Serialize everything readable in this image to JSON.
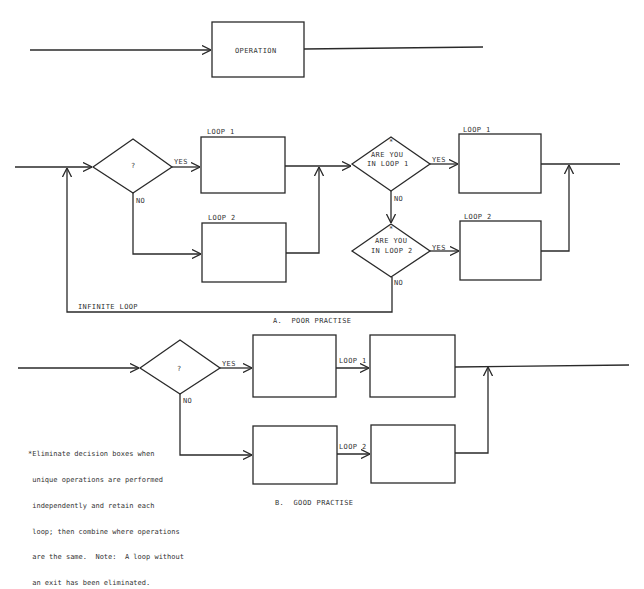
{
  "top": {
    "operation_label": "OPERATION"
  },
  "poor": {
    "decision_label": "?",
    "yes_label": "YES",
    "no_label": "NO",
    "loop1_label": "LOOP 1",
    "loop2_label": "LOOP 2",
    "check1_star": "*",
    "check1_line1": "ARE YOU",
    "check1_line2": "IN LOOP 1",
    "check1_yes": "YES",
    "check1_no": "NO",
    "check2_star": "*",
    "check2_line1": "ARE YOU",
    "check2_line2": "IN LOOP 2",
    "check2_yes": "YES",
    "check2_no": "NO",
    "out_loop1_label": "LOOP 1",
    "out_loop2_label": "LOOP 2",
    "infinite_loop_label": "INFINITE LOOP",
    "caption": "A.  POOR PRACTISE"
  },
  "good": {
    "decision_label": "?",
    "yes_label": "YES",
    "no_label": "NO",
    "loop1_label": "LOOP 1",
    "loop2_label": "LOOP 2",
    "caption": "B.  GOOD PRACTISE"
  },
  "footnote": {
    "lines": [
      "*Eliminate decision boxes when",
      " unique operations are performed",
      " independently and retain each",
      " loop; then combine where operations",
      " are the same.  Note:  A loop without",
      " an exit has been eliminated."
    ]
  }
}
